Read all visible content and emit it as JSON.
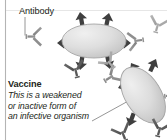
{
  "figure": {
    "name": "vaccine-antibody-diagram",
    "background_color": "#ffffff",
    "width": 167,
    "height": 140
  },
  "labels": {
    "antibody": "Antibody",
    "vaccine_title": "Vaccine",
    "vaccine_desc_line1": "This is a weakened",
    "vaccine_desc_line2": "or inactive form of",
    "vaccine_desc_line3": "an infective organism"
  },
  "colors": {
    "text": "#231f20",
    "organism_fill": "#d3d3d3",
    "organism_light": "#ececec",
    "organism_stroke": "#9a9a9a",
    "arrow_dark": "#3f3f3f",
    "antibody_mid": "#8e8e8e",
    "antibody_dark": "#5a5a5a",
    "leader_line": "#8a8a8a",
    "border_line": "#b4b4b4"
  },
  "elements": {
    "organism_top": {
      "name": "infective-organism-top",
      "shape": "ellipse",
      "cx": 94,
      "cy": 41,
      "rx": 32,
      "ry": 17,
      "rotation": 0,
      "arrow_count": 6
    },
    "organism_bottom": {
      "name": "infective-organism-bottom",
      "shape": "ellipse",
      "cx": 143,
      "cy": 95,
      "rx": 18,
      "ry": 31,
      "rotation": -35,
      "arrow_count": 5
    },
    "antibody_glyph_count": 8,
    "antibody_leader_line": {
      "x1": 25,
      "y1": 18,
      "x2": 25,
      "y2": 35
    },
    "vaccine_leader_line": {
      "x1": 98,
      "y1": 120,
      "x2": 143,
      "y2": 95
    }
  }
}
